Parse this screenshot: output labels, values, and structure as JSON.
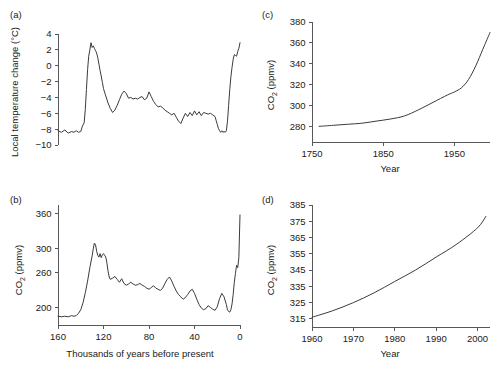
{
  "figure": {
    "panels": [
      {
        "id": "a",
        "label": "(a)",
        "ylabel": "Local  temperature change (°C)",
        "xlabel": ""
      },
      {
        "id": "b",
        "label": "(b)",
        "ylabel_main": "CO",
        "ylabel_sub": "2",
        "ylabel_tail": " (ppmv)",
        "xlabel": "Thousands of years before present"
      },
      {
        "id": "c",
        "label": "(c)",
        "ylabel_main": "CO",
        "ylabel_sub": "2",
        "ylabel_tail": " (ppmv)",
        "xlabel": "Year"
      },
      {
        "id": "d",
        "label": "(d)",
        "ylabel_main": "CO",
        "ylabel_sub": "2",
        "ylabel_tail": " (ppmv)",
        "xlabel": "Year"
      }
    ]
  },
  "chart_data": [
    {
      "panel": "a",
      "type": "line",
      "title": "",
      "xlabel": "Thousands of years before present",
      "ylabel": "Local  temperature change (°C)",
      "xlim": [
        160,
        0
      ],
      "ylim": [
        -10,
        4
      ],
      "x_reversed": true,
      "grid": false,
      "legend": "none",
      "xticks": [
        160,
        120,
        80,
        40,
        0
      ],
      "xtick_labels": [
        "",
        "",
        "",
        "",
        ""
      ],
      "yticks": [
        4,
        2,
        0,
        -2,
        -4,
        -6,
        -8,
        -10
      ],
      "ytick_labels": [
        "4",
        "2",
        "0",
        "−2",
        "−4",
        "−6",
        "−8",
        "−10"
      ],
      "x": [
        160,
        157,
        154,
        151,
        148,
        146,
        144,
        142,
        140,
        138.5,
        137,
        136,
        135,
        134,
        133,
        132,
        131,
        130,
        129,
        128,
        127,
        126,
        125,
        124,
        123,
        122,
        121,
        120,
        118,
        116,
        114,
        112,
        110,
        108,
        106,
        104,
        102,
        100,
        98,
        96,
        94,
        92,
        90,
        88,
        86,
        84,
        82,
        80,
        78,
        76,
        74,
        72,
        70,
        68,
        66,
        64,
        62,
        60,
        58,
        56,
        54,
        52,
        50,
        48,
        46,
        44,
        42,
        40,
        38,
        36,
        34,
        32,
        30,
        28,
        26,
        24,
        22,
        21,
        20,
        19,
        18,
        17,
        16,
        15,
        14,
        13,
        12,
        11,
        10,
        9,
        8,
        7,
        6,
        5,
        4,
        3,
        2,
        1,
        0
      ],
      "y": [
        -8.2,
        -8.4,
        -8.1,
        -8.5,
        -8.3,
        -8.4,
        -8.2,
        -8.4,
        -8.3,
        -7.6,
        -7.2,
        -5.5,
        -3.0,
        -0.5,
        1.2,
        2.0,
        2.9,
        2.3,
        2.5,
        2.2,
        1.9,
        1.6,
        1.0,
        0.2,
        -0.6,
        -1.3,
        -2.1,
        -2.9,
        -3.8,
        -4.7,
        -5.4,
        -5.9,
        -5.6,
        -5.0,
        -4.3,
        -3.6,
        -3.2,
        -3.5,
        -4.1,
        -4.0,
        -4.2,
        -4.1,
        -4.2,
        -4.0,
        -3.9,
        -4.3,
        -4.1,
        -3.3,
        -3.9,
        -4.5,
        -4.9,
        -5.2,
        -5.1,
        -5.3,
        -5.6,
        -5.8,
        -6.0,
        -6.2,
        -6.0,
        -6.5,
        -7.0,
        -7.3,
        -6.6,
        -6.0,
        -6.4,
        -5.9,
        -6.3,
        -5.7,
        -6.2,
        -5.8,
        -6.3,
        -5.9,
        -6.0,
        -6.1,
        -6.0,
        -6.2,
        -6.4,
        -6.9,
        -7.4,
        -7.9,
        -8.2,
        -8.4,
        -8.2,
        -8.4,
        -8.3,
        -8.4,
        -8.2,
        -7.0,
        -5.0,
        -3.0,
        -1.4,
        -0.2,
        0.8,
        1.4,
        1.3,
        1.2,
        1.8,
        2.2,
        2.9
      ],
      "units": "°C"
    },
    {
      "panel": "b",
      "type": "line",
      "title": "",
      "xlabel": "Thousands of years before present",
      "ylabel": "CO2 (ppmv)",
      "xlim": [
        160,
        0
      ],
      "ylim": [
        170,
        375
      ],
      "x_reversed": true,
      "grid": false,
      "legend": "none",
      "xticks": [
        160,
        120,
        80,
        40,
        0
      ],
      "xtick_labels": [
        "160",
        "120",
        "80",
        "40",
        "0"
      ],
      "yticks": [
        200,
        260,
        300,
        360
      ],
      "ytick_labels": [
        "200",
        "260",
        "300",
        "360"
      ],
      "x": [
        160,
        157,
        154,
        151,
        148,
        146,
        144,
        142,
        140,
        138,
        136,
        134,
        132,
        130,
        129,
        128,
        127,
        126,
        125,
        124,
        123,
        122,
        121,
        120,
        119,
        118,
        117,
        116,
        115,
        114,
        112,
        110,
        108,
        106,
        104,
        102,
        100,
        98,
        96,
        94,
        92,
        90,
        88,
        86,
        84,
        82,
        80,
        78,
        76,
        74,
        72,
        70,
        68,
        66,
        64,
        62,
        60,
        58,
        56,
        54,
        52,
        50,
        48,
        46,
        44,
        42,
        40,
        38,
        36,
        34,
        32,
        30,
        28,
        26,
        24,
        22,
        20,
        18,
        16,
        14,
        12,
        11,
        10,
        9,
        8,
        7,
        6,
        5,
        4,
        3,
        2,
        1,
        0
      ],
      "y": [
        185,
        184,
        185,
        184,
        186,
        185,
        186,
        190,
        196,
        208,
        225,
        245,
        268,
        288,
        300,
        310,
        307,
        296,
        289,
        286,
        292,
        285,
        290,
        292,
        289,
        286,
        276,
        262,
        252,
        248,
        250,
        253,
        248,
        243,
        249,
        241,
        238,
        240,
        243,
        240,
        238,
        239,
        241,
        238,
        236,
        233,
        231,
        234,
        237,
        233,
        231,
        229,
        233,
        241,
        248,
        252,
        245,
        236,
        228,
        222,
        218,
        214,
        217,
        222,
        228,
        231,
        224,
        214,
        205,
        199,
        196,
        198,
        203,
        200,
        197,
        195,
        201,
        215,
        224,
        218,
        205,
        196,
        193,
        192,
        196,
        206,
        222,
        243,
        258,
        272,
        268,
        285,
        358
      ],
      "units": "ppmv"
    },
    {
      "panel": "c",
      "type": "line",
      "title": "",
      "xlabel": "Year",
      "ylabel": "CO2 (ppmv)",
      "xlim": [
        1750,
        2000
      ],
      "ylim": [
        265,
        380
      ],
      "grid": false,
      "legend": "none",
      "xticks": [
        1750,
        1850,
        1950
      ],
      "xtick_labels": [
        "1750",
        "1850",
        "1950"
      ],
      "yticks": [
        280,
        300,
        320,
        340,
        360,
        380
      ],
      "ytick_labels": [
        "280",
        "300",
        "320",
        "340",
        "360",
        "380"
      ],
      "x": [
        1760,
        1780,
        1800,
        1820,
        1840,
        1860,
        1880,
        1900,
        1920,
        1940,
        1950,
        1960,
        1970,
        1980,
        1990,
        2000
      ],
      "y": [
        280,
        281,
        282,
        283,
        285,
        287,
        290,
        296,
        303,
        310,
        313,
        317,
        325,
        338,
        354,
        370
      ],
      "units": "ppmv"
    },
    {
      "panel": "d",
      "type": "line",
      "title": "",
      "xlabel": "Year",
      "ylabel": "CO2 (ppmv)",
      "xlim": [
        1960,
        2003
      ],
      "ylim": [
        310,
        385
      ],
      "grid": false,
      "legend": "none",
      "xticks": [
        1960,
        1970,
        1980,
        1990,
        2000
      ],
      "xtick_labels": [
        "1960",
        "1970",
        "1980",
        "1990",
        "2000"
      ],
      "yticks": [
        315,
        325,
        335,
        345,
        355,
        365,
        375,
        385
      ],
      "ytick_labels": [
        "315",
        "325",
        "335",
        "345",
        "355",
        "365",
        "375",
        "385"
      ],
      "x": [
        1960,
        1965,
        1970,
        1975,
        1980,
        1985,
        1990,
        1995,
        2000,
        2002
      ],
      "y": [
        316,
        320,
        325,
        331,
        338,
        345,
        353,
        361,
        371,
        378
      ],
      "units": "ppmv"
    }
  ]
}
